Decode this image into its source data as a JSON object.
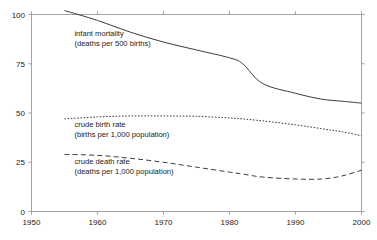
{
  "chart_data": {
    "type": "line",
    "title": "",
    "subtitle": "",
    "xlabel": "",
    "ylabel": "",
    "xlim": [
      1950,
      2000
    ],
    "ylim": [
      0,
      100
    ],
    "grid": false,
    "legend_position": "inline-annotations",
    "x_ticks": [
      "1950",
      "1960",
      "1970",
      "1980",
      "1990",
      "2000"
    ],
    "x_tick_values": [
      1950,
      1960,
      1970,
      1980,
      1990,
      2000
    ],
    "y_ticks": [
      "0",
      "25",
      "50",
      "75",
      "100"
    ],
    "y_tick_values": [
      0,
      25,
      50,
      75,
      100
    ],
    "x": [
      1955,
      1960,
      1965,
      1970,
      1975,
      1980,
      1982,
      1985,
      1990,
      1994,
      1997,
      2000
    ],
    "series": [
      {
        "name": "infant mortality",
        "style": "solid",
        "annotation_line1": "infant mortality",
        "annotation_line2": "(deaths per 500 births)",
        "values": [
          102,
          97,
          91,
          86,
          82,
          78,
          75,
          65,
          60,
          57,
          56,
          55
        ]
      },
      {
        "name": "crude birth rate",
        "style": "dotted",
        "annotation_line1": "crude birth rate",
        "annotation_line2": "(births per 1,000 population)",
        "values": [
          47,
          48,
          48.5,
          48.5,
          48.3,
          47.5,
          47,
          46,
          44,
          42,
          40.5,
          38.5
        ]
      },
      {
        "name": "crude death rate",
        "style": "dashed",
        "annotation_line1": "crude death rate",
        "annotation_line2": "(deaths per 1,000 population)",
        "values": [
          29,
          28.5,
          27,
          25,
          22.5,
          20,
          19,
          17.5,
          16.5,
          16.5,
          18,
          21
        ]
      }
    ],
    "annotations": [
      {
        "line1": "infant mortality",
        "line2": "(deaths per 500 births)",
        "x": 1956.5,
        "y": 89
      },
      {
        "line1": "crude birth rate",
        "line2": "(births per 1,000 population)",
        "x": 1956.5,
        "y": 43
      },
      {
        "line1": "crude death rate",
        "line2": "(deaths per 1,000 population)",
        "x": 1956.5,
        "y": 24
      }
    ],
    "colors": {
      "line": "#3c3c3c",
      "axis": "#9a9a9a",
      "text": "#1a1a1a",
      "background": "#ffffff"
    }
  }
}
